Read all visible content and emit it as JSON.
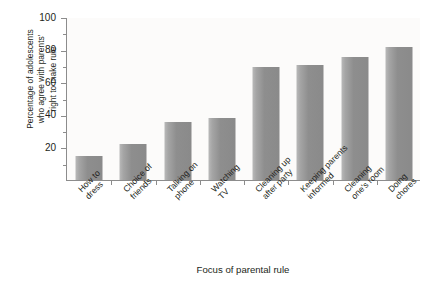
{
  "chart_data": {
    "type": "bar",
    "title": "",
    "xlabel": "Focus of parental rule",
    "ylabel": "Percentage of adolescents who agree with parents' right to make rule",
    "ylabel_lines": [
      "Percentage of adolescents",
      "who agree with parents'",
      "right to make rule"
    ],
    "categories": [
      "How to dress",
      "Choice of friends",
      "Talking on phone",
      "Watching TV",
      "Cleaning up after party",
      "Keeping parents informed",
      "Cleaning one's room",
      "Doing chores"
    ],
    "category_lines": [
      [
        "How to",
        "dress"
      ],
      [
        "Choice of",
        "friends"
      ],
      [
        "Talking on",
        "phone"
      ],
      [
        "Watching",
        "TV"
      ],
      [
        "Cleaning up",
        "after party"
      ],
      [
        "Keeping parents",
        "informed"
      ],
      [
        "Cleaning",
        "one's room"
      ],
      [
        "Doing",
        "chores"
      ]
    ],
    "values": [
      15,
      22,
      36,
      38,
      70,
      71,
      76,
      82
    ],
    "ylim": [
      0,
      100
    ],
    "ytick_labels": [
      "20",
      "40",
      "60",
      "80",
      "100"
    ],
    "ytick_values": [
      20,
      40,
      60,
      80,
      100
    ],
    "yminor_values": [
      10,
      30,
      50,
      70,
      90
    ],
    "grid": false,
    "legend": "none",
    "bar_color": "#8a8a8a",
    "axis_color": "#8c8c8c",
    "plot_bg": "#fcfbfa",
    "text_color": "#231f20"
  }
}
